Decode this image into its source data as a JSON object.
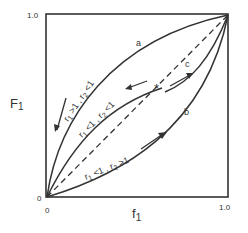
{
  "diagram": {
    "y_axis": {
      "label": "F",
      "subscript": "1",
      "tick_top": "1.0",
      "tick_origin": "0"
    },
    "x_axis": {
      "label": "f",
      "subscript": "1",
      "tick_right": "1.0",
      "tick_origin": "0"
    },
    "curves": [
      {
        "id": "a",
        "label": "a",
        "condition": "r1 >1, r2 <1",
        "cond_parts": [
          "r",
          "1",
          " >1 , r",
          "2",
          " <1"
        ],
        "style": "solid",
        "arrow": "toward origin"
      },
      {
        "id": "azeotrope",
        "condition": "r1 <1, r2 <1",
        "cond_parts": [
          "r",
          "1",
          " <1 , r",
          "2",
          " <1"
        ],
        "style": "solid",
        "marker": "*",
        "arrow": "away from azeotrope"
      },
      {
        "id": "b",
        "label": "b",
        "condition": "r1 <1, r2 >1",
        "cond_parts": [
          "r",
          "1",
          " <1 , r",
          "2",
          " >1"
        ],
        "style": "solid",
        "arrow": "toward (1,1)"
      },
      {
        "id": "c",
        "label": "c",
        "style": "solid",
        "arrow": "toward (1,1)"
      },
      {
        "id": "ideal",
        "style": "dashed",
        "description": "diagonal F1 = f1"
      }
    ],
    "marker": "*"
  }
}
